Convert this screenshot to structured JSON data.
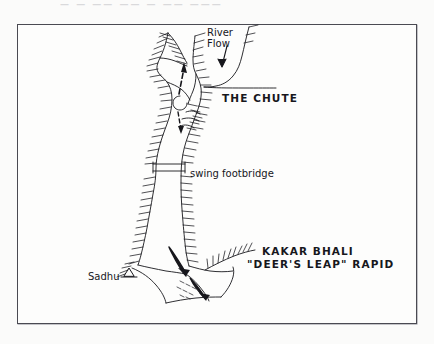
{
  "page": {
    "background_color": "#fbfbfa",
    "frame_color": "#4a4a52",
    "ink_color": "#17171c",
    "top_bleed_text": "—  —  ——   ——  —   ——  ———"
  },
  "figure": {
    "type": "hand-drawn sketch map",
    "labels": {
      "river_flow": "River\nFlow",
      "the_chute": "THE CHUTE",
      "swing_footbridge": "swing footbridge",
      "sadhu": "Sadhu",
      "rapid_name": "KAKAR BHALI",
      "rapid_nickname": "\"DEER'S LEAP\" RAPID"
    },
    "features": [
      {
        "name": "river-flow-arrow",
        "kind": "arrow",
        "direction": "down"
      },
      {
        "name": "chute-flow-arrow",
        "kind": "arrow",
        "direction": "up"
      },
      {
        "name": "rapid-flow-arrow",
        "kind": "arrow",
        "direction": "down-right"
      },
      {
        "name": "swing-footbridge",
        "kind": "bridge"
      },
      {
        "name": "sadhu-hut",
        "kind": "hut-symbol"
      },
      {
        "name": "left-bank",
        "kind": "hachured-bank"
      },
      {
        "name": "right-bank",
        "kind": "hachured-bank"
      },
      {
        "name": "rock-spur",
        "kind": "hachured-spur"
      }
    ]
  }
}
